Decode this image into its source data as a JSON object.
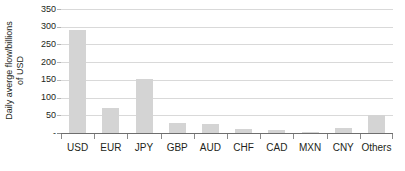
{
  "chart_data": {
    "type": "bar",
    "title": "",
    "subtitle": "",
    "xlabel": "",
    "ylabel": "Daily averge flow/billions of USD",
    "ylabel_lines": [
      "Daily averge flow/billions",
      "of USD"
    ],
    "categories": [
      "USD",
      "EUR",
      "JPY",
      "GBP",
      "AUD",
      "CHF",
      "CAD",
      "MXN",
      "CNY",
      "Others"
    ],
    "values": [
      292,
      70,
      152,
      27,
      25,
      12,
      8,
      4,
      15,
      50
    ],
    "series": [
      {
        "name": "Daily average flow",
        "values": [
          292,
          70,
          152,
          27,
          25,
          12,
          8,
          4,
          15,
          50
        ]
      }
    ],
    "ylim": [
      0,
      350
    ],
    "ytick_values": [
      0,
      50,
      100,
      150,
      200,
      250,
      300,
      350
    ],
    "ytick_labels": [
      "-",
      "50",
      "100",
      "150",
      "200",
      "250",
      "300",
      "350"
    ],
    "grid": "horizontal",
    "legend": "none",
    "bar_color": "#d4d4d4",
    "gridline_color": "#d9d9d9",
    "axis_color": "#6e6e6e",
    "text_color": "#231f20"
  }
}
